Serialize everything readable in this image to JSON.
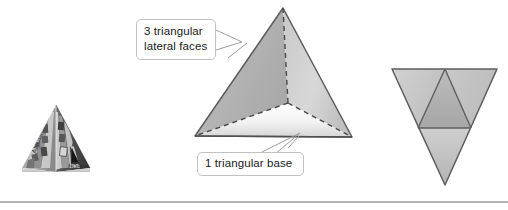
{
  "figure": {
    "background_color": "#ffffff",
    "width": 508,
    "height": 210
  },
  "callouts": [
    {
      "id": "lateral-faces",
      "text": "3 triangular\nlateral faces",
      "line1": "3 triangular",
      "line2": "lateral faces",
      "border_color": "#c2c2c2",
      "fill_color": "#ffffff",
      "text_color": "#1a1a1a"
    },
    {
      "id": "triangular-base",
      "text": "1 triangular base",
      "border_color": "#c2c2c2",
      "fill_color": "#ffffff",
      "text_color": "#1a1a1a"
    }
  ],
  "photo": {
    "caption": "Photograph of a decorative stone pyramid with carved hieroglyph panels",
    "alt_name": "egyptian-pyramid-photo"
  },
  "pyramid_3d": {
    "name": "triangular-pyramid",
    "apex": [
      283,
      8
    ],
    "base_front_left": [
      195,
      136
    ],
    "base_front_right": [
      352,
      137
    ],
    "base_back": [
      288,
      103
    ],
    "left_face_color": "#b7b7b7",
    "right_face_color": "#cfcfcf",
    "base_face_color": "#eeeeee",
    "edge_color": "#595959",
    "hidden_edge_style": "dashed"
  },
  "net_view": {
    "name": "pyramid-net",
    "outer_top_left": [
      392,
      69
    ],
    "outer_top_right": [
      497,
      69
    ],
    "outer_bottom": [
      445,
      185
    ],
    "inner_apex": [
      445,
      69
    ],
    "inner_left": [
      418,
      128
    ],
    "inner_right": [
      471,
      128
    ],
    "outer_fill": "#c4c4c4",
    "inner_fill": "#b0b0b0",
    "edge_color": "#5e5e5e"
  },
  "divider": {
    "name": "bottom-rule",
    "color": "#9a9a9a",
    "y": 202
  }
}
